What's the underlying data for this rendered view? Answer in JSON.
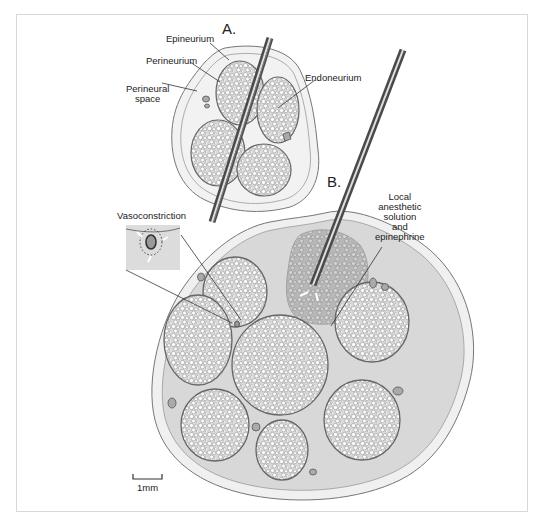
{
  "figure": {
    "panel_a_label": "A.",
    "panel_b_label": "B.",
    "labels": {
      "epineurium": "Epineurium",
      "perineurium": "Perineurium",
      "perineural_space_1": "Perineural",
      "perineural_space_2": "space",
      "endoneurium": "Endoneurium",
      "vasoconstriction": "Vasoconstriction",
      "local_1": "Local",
      "local_2": "anesthetic",
      "local_3": "solution",
      "local_4": "and",
      "local_5": "epinephrine"
    },
    "scale_bar": "1mm"
  },
  "colors": {
    "epineurium_fill": "#f2f2f2",
    "fascicle_fill": "#e6e6e6",
    "perineural_fill": "#d6d6d6",
    "outline": "#777777",
    "anesthetic_fill": "#bdbdbd",
    "needle": "#5a5a5a"
  }
}
